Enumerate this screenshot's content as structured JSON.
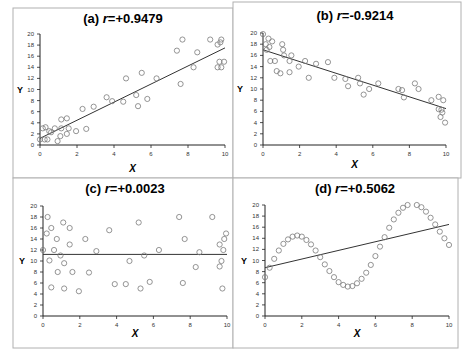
{
  "figure": {
    "width": 466,
    "height": 360,
    "border_color": "#b0b0b0",
    "axis_color": "#222222",
    "marker_color": "#7a7a7a",
    "line_color": "#333333"
  },
  "chart_data": [
    {
      "type": "scatter",
      "panel": "a",
      "title_prefix": "(a) ",
      "title_r": "r",
      "title_value": "=+0.9479",
      "xlabel": "X",
      "ylabel": "Y",
      "xlim": [
        0,
        10
      ],
      "ylim": [
        0,
        20
      ],
      "xticks": [
        0,
        2,
        4,
        6,
        8,
        10
      ],
      "yticks": [
        0,
        2,
        4,
        6,
        8,
        10,
        12,
        14,
        16,
        18,
        20
      ],
      "grid": false,
      "trendline": {
        "x": [
          0,
          10
        ],
        "y": [
          1.2,
          17.5
        ]
      },
      "points": [
        [
          0,
          1
        ],
        [
          0.15,
          3
        ],
        [
          0.25,
          1
        ],
        [
          0.3,
          3.2
        ],
        [
          0.4,
          1
        ],
        [
          0.5,
          2.5
        ],
        [
          0.6,
          2.3
        ],
        [
          0.8,
          3
        ],
        [
          0.95,
          0.7
        ],
        [
          1.1,
          1.6
        ],
        [
          1.15,
          4.6
        ],
        [
          1.15,
          3
        ],
        [
          1.45,
          4.8
        ],
        [
          1.45,
          2
        ],
        [
          1.55,
          3
        ],
        [
          1.95,
          2.5
        ],
        [
          2.3,
          6.5
        ],
        [
          2.5,
          2.9
        ],
        [
          2.9,
          6.9
        ],
        [
          3.6,
          8.6
        ],
        [
          3.9,
          7.9
        ],
        [
          4.5,
          7.8
        ],
        [
          4.65,
          12
        ],
        [
          5.2,
          9
        ],
        [
          5.3,
          7
        ],
        [
          5.5,
          13
        ],
        [
          5.8,
          8.3
        ],
        [
          6.3,
          12
        ],
        [
          7.4,
          17
        ],
        [
          7.6,
          11
        ],
        [
          7.7,
          19
        ],
        [
          8.3,
          14
        ],
        [
          8.5,
          16.7
        ],
        [
          9.2,
          19
        ],
        [
          9.6,
          18.1
        ],
        [
          9.6,
          14
        ],
        [
          9.7,
          15
        ],
        [
          9.75,
          18.5
        ],
        [
          9.8,
          19
        ],
        [
          9.8,
          14
        ],
        [
          9.95,
          15
        ]
      ]
    },
    {
      "type": "scatter",
      "panel": "b",
      "title_prefix": "(b) ",
      "title_r": "r",
      "title_value": "=-0.9214",
      "xlabel": "X",
      "ylabel": "Y",
      "xlim": [
        0,
        10
      ],
      "ylim": [
        0,
        20
      ],
      "xticks": [
        0,
        2,
        4,
        6,
        8,
        10
      ],
      "yticks": [
        0,
        2,
        4,
        6,
        8,
        10,
        12,
        14,
        16,
        18,
        20
      ],
      "grid": false,
      "trendline": {
        "x": [
          0,
          10
        ],
        "y": [
          17,
          6.5
        ]
      },
      "points": [
        [
          0,
          19.8
        ],
        [
          0.15,
          18
        ],
        [
          0.2,
          17
        ],
        [
          0.3,
          19
        ],
        [
          0.35,
          17.5
        ],
        [
          0.4,
          15
        ],
        [
          0.5,
          18.5
        ],
        [
          0.65,
          15
        ],
        [
          0.75,
          13.2
        ],
        [
          0.95,
          12.8
        ],
        [
          1.05,
          18
        ],
        [
          1.1,
          17
        ],
        [
          1.15,
          16
        ],
        [
          1.45,
          13
        ],
        [
          1.45,
          15
        ],
        [
          1.55,
          16
        ],
        [
          1.95,
          14
        ],
        [
          2.3,
          15
        ],
        [
          2.5,
          12
        ],
        [
          2.9,
          14.5
        ],
        [
          3.55,
          14.8
        ],
        [
          3.9,
          12
        ],
        [
          4.5,
          11.8
        ],
        [
          4.65,
          10.5
        ],
        [
          5.2,
          12
        ],
        [
          5.3,
          11
        ],
        [
          5.5,
          9
        ],
        [
          5.8,
          10
        ],
        [
          6.3,
          11
        ],
        [
          7.4,
          10
        ],
        [
          7.6,
          9.8
        ],
        [
          7.7,
          8.5
        ],
        [
          8.3,
          11
        ],
        [
          8.5,
          10
        ],
        [
          9.2,
          8
        ],
        [
          9.6,
          8.6
        ],
        [
          9.6,
          6.4
        ],
        [
          9.7,
          5
        ],
        [
          9.75,
          6.3
        ],
        [
          9.8,
          5.8
        ],
        [
          9.85,
          8
        ],
        [
          9.95,
          4
        ]
      ]
    },
    {
      "type": "scatter",
      "panel": "c",
      "title_prefix": "(c) ",
      "title_r": "r",
      "title_value": "=+0.0023",
      "xlabel": "X",
      "ylabel": "Y",
      "xlim": [
        0,
        10
      ],
      "ylim": [
        0,
        20
      ],
      "xticks": [
        0,
        2,
        4,
        6,
        8,
        10
      ],
      "yticks": [
        0,
        2,
        4,
        6,
        8,
        10,
        12,
        14,
        16,
        18,
        20
      ],
      "grid": false,
      "trendline": {
        "x": [
          0,
          10
        ],
        "y": [
          11.2,
          11.2
        ]
      },
      "points": [
        [
          0,
          12
        ],
        [
          0.2,
          15
        ],
        [
          0.25,
          18
        ],
        [
          0.35,
          10.1
        ],
        [
          0.45,
          16
        ],
        [
          0.45,
          5.2
        ],
        [
          0.6,
          12
        ],
        [
          0.75,
          14
        ],
        [
          0.8,
          8
        ],
        [
          0.95,
          11
        ],
        [
          1.1,
          17
        ],
        [
          1.15,
          9.6
        ],
        [
          1.15,
          5
        ],
        [
          1.45,
          16
        ],
        [
          1.45,
          13
        ],
        [
          1.6,
          8
        ],
        [
          1.95,
          4.5
        ],
        [
          2.3,
          14
        ],
        [
          2.5,
          7.9
        ],
        [
          2.9,
          11.8
        ],
        [
          3.6,
          15.6
        ],
        [
          3.9,
          5.8
        ],
        [
          4.5,
          5.8
        ],
        [
          4.7,
          10
        ],
        [
          5.2,
          17
        ],
        [
          5.3,
          5
        ],
        [
          5.5,
          11
        ],
        [
          5.8,
          6.2
        ],
        [
          6.3,
          12
        ],
        [
          7.4,
          18
        ],
        [
          7.6,
          6
        ],
        [
          7.7,
          14
        ],
        [
          8.3,
          8.9
        ],
        [
          8.5,
          11.6
        ],
        [
          9.2,
          18
        ],
        [
          9.6,
          13
        ],
        [
          9.6,
          9
        ],
        [
          9.7,
          10
        ],
        [
          9.75,
          5
        ],
        [
          9.8,
          12
        ],
        [
          9.85,
          14
        ],
        [
          9.95,
          15
        ]
      ]
    },
    {
      "type": "scatter",
      "panel": "d",
      "title_prefix": "(d) ",
      "title_r": "r",
      "title_value": "=+0.5062",
      "xlabel": "X",
      "ylabel": "Y",
      "xlim": [
        0,
        10
      ],
      "ylim": [
        0,
        20
      ],
      "xticks": [
        0,
        2,
        4,
        6,
        8,
        10
      ],
      "yticks": [
        0,
        2,
        4,
        6,
        8,
        10,
        12,
        14,
        16,
        18,
        20
      ],
      "grid": false,
      "trendline": {
        "x": [
          0,
          10
        ],
        "y": [
          8.7,
          16.5
        ]
      },
      "points": [
        [
          0,
          7
        ],
        [
          0.25,
          8.7
        ],
        [
          0.5,
          10.3
        ],
        [
          0.75,
          11.8
        ],
        [
          1,
          13
        ],
        [
          1.25,
          13.8
        ],
        [
          1.5,
          14.3
        ],
        [
          1.75,
          14.5
        ],
        [
          2,
          14.3
        ],
        [
          2.25,
          13.7
        ],
        [
          2.5,
          12.9
        ],
        [
          2.75,
          11.8
        ],
        [
          3,
          10.6
        ],
        [
          3.25,
          9.3
        ],
        [
          3.5,
          8.1
        ],
        [
          3.75,
          7
        ],
        [
          4,
          6.1
        ],
        [
          4.25,
          5.6
        ],
        [
          4.5,
          5.3
        ],
        [
          4.75,
          5.4
        ],
        [
          5,
          5.9
        ],
        [
          5.25,
          6.7
        ],
        [
          5.5,
          7.8
        ],
        [
          5.75,
          9.2
        ],
        [
          6,
          10.8
        ],
        [
          6.25,
          12.5
        ],
        [
          6.5,
          14.2
        ],
        [
          6.75,
          15.9
        ],
        [
          7,
          17.4
        ],
        [
          7.25,
          18.6
        ],
        [
          7.5,
          19.5
        ],
        [
          7.75,
          20
        ],
        [
          8.25,
          20
        ],
        [
          8.5,
          19.6
        ],
        [
          8.75,
          18.8
        ],
        [
          9,
          17.7
        ],
        [
          9.25,
          16.5
        ],
        [
          9.5,
          15.2
        ],
        [
          9.75,
          14
        ],
        [
          10,
          12.8
        ]
      ]
    }
  ]
}
